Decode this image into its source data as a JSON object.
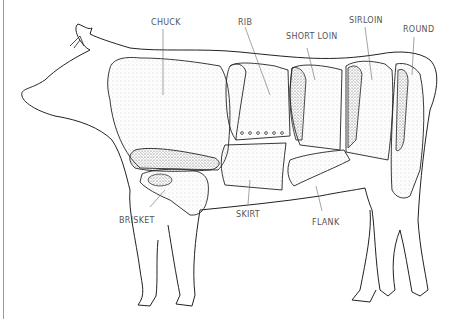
{
  "diagram": {
    "labels": {
      "chuck": "CHUCK",
      "rib": "RIB",
      "short_loin": "SHORT LOIN",
      "sirloin": "SIRLOIN",
      "round": "ROUND",
      "brisket": "BRISKET",
      "skirt": "SKIRT",
      "flank": "FLANK"
    },
    "colors": {
      "outline": "#222222",
      "stipple": "#888888",
      "label": "#555555",
      "background": "#ffffff"
    }
  }
}
